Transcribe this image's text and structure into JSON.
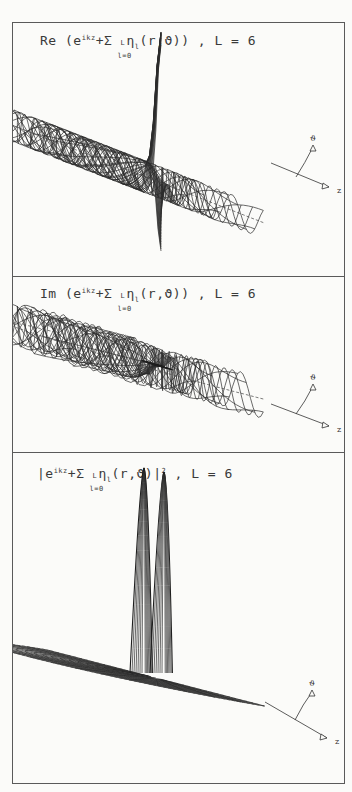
{
  "figure": {
    "panels": [
      {
        "id": "real",
        "title": {
          "prefix": "Re",
          "open": "(e",
          "exp": "ikz",
          "plus": "+Σ",
          "sum_upper": "L",
          "sum_lower": "l=0",
          "body": "η",
          "body_sub": "l",
          "args": "(r,ϑ))",
          "suffix": " , L = 6"
        },
        "plot": {
          "type": "surface-wireframe",
          "quantity": "real part",
          "L": 6,
          "feature": "sharp central positive spike with deep negative trough, oscillating ripples along z"
        },
        "axes": {
          "theta_label": "ϑ",
          "z_label": "z"
        }
      },
      {
        "id": "imag",
        "title": {
          "prefix": "Im",
          "open": "(e",
          "exp": "ikz",
          "plus": "+Σ",
          "sum_upper": "L",
          "sum_lower": "l=0",
          "body": "η",
          "body_sub": "l",
          "args": "(r,ϑ))",
          "suffix": " , L = 6"
        },
        "plot": {
          "type": "surface-wireframe",
          "quantity": "imaginary part",
          "L": 6,
          "feature": "oscillating ripples along z, dense mesh near origin"
        },
        "axes": {
          "theta_label": "ϑ",
          "z_label": "z"
        }
      },
      {
        "id": "modsq",
        "title": {
          "prefix": "|e",
          "open": "",
          "exp": "ikz",
          "plus": "+Σ",
          "sum_upper": "L",
          "sum_lower": "l=0",
          "body": "η",
          "body_sub": "l",
          "args": "(r,ϑ)|",
          "power": "2",
          "suffix": " , L = 6"
        },
        "plot": {
          "type": "surface-wireframe",
          "quantity": "modulus squared",
          "L": 6,
          "feature": "two tall narrow peaks near origin on a flat polar half-disk mesh"
        },
        "axes": {
          "theta_label": "ϑ",
          "z_label": "z"
        }
      }
    ]
  },
  "chart_data": [
    {
      "type": "surface",
      "title": "Re (e^{ikz} + Σ_{l=0}^{L} η_l(r,ϑ)), L = 6",
      "xlabel": "z",
      "ylabel": "ϑ",
      "L": 6,
      "description": "Wireframe 3D surface in polar coords (r,ϑ); ripples of e^{ikz}, tall central positive spike and deep negative trough at origin"
    },
    {
      "type": "surface",
      "title": "Im (e^{ikz} + Σ_{l=0}^{L} η_l(r,ϑ)), L = 6",
      "xlabel": "z",
      "ylabel": "ϑ",
      "L": 6,
      "description": "Wireframe 3D surface; sinusoidal ripples along z, dense small-amplitude mesh near origin"
    },
    {
      "type": "surface",
      "title": "|e^{ikz} + Σ_{l=0}^{L} η_l(r,ϑ)|^2, L = 6",
      "xlabel": "z",
      "ylabel": "ϑ",
      "L": 6,
      "description": "Wireframe 3D surface on a polar half-disk; flat base with two tall narrow peaks near the origin"
    }
  ]
}
